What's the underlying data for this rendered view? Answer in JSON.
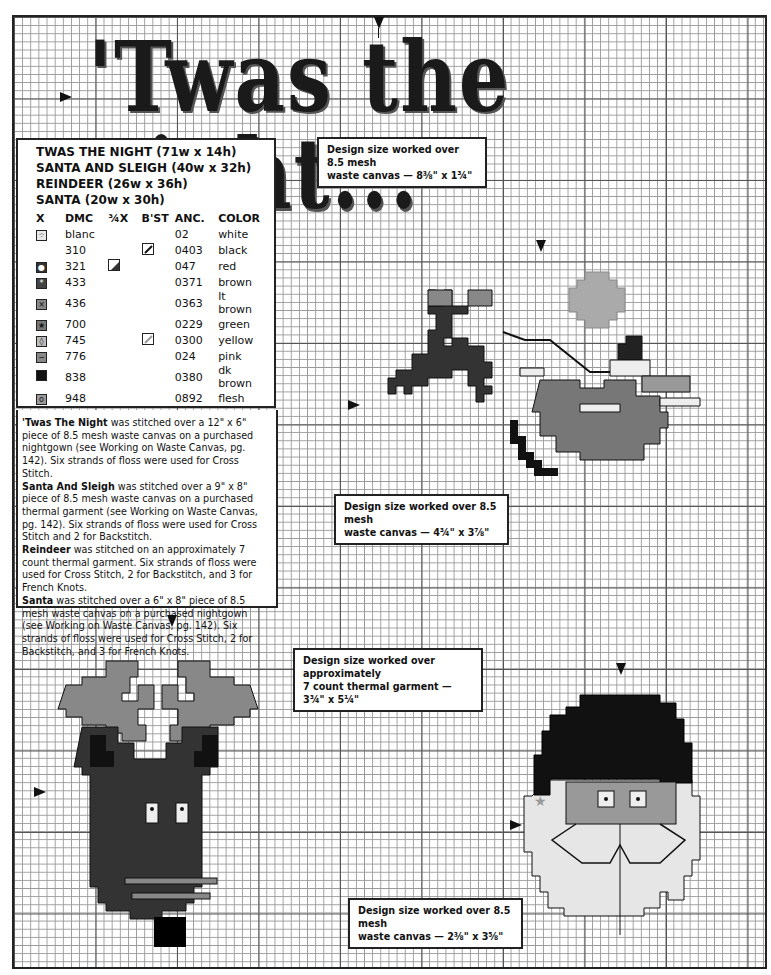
{
  "page": {
    "title_text": "'Twas the night...",
    "colors": {
      "grid_line": "#999999",
      "black": "#111111",
      "dark_brown": "#2a2a2a",
      "brown": "#444444",
      "red": "#3a3a3a",
      "lt_brown": "#8a8a8a",
      "green": "#7a7a7a",
      "yellow": "#bbbbbb",
      "pink": "#888888",
      "flesh": "#9a9a9a",
      "white": "#eeeeee"
    }
  },
  "legend": {
    "headings": [
      "TWAS THE NIGHT (71w x 14h)",
      "SANTA AND SLEIGH (40w x 32h)",
      "REINDEER (26w x 36h)",
      "SANTA (20w x 30h)"
    ],
    "columns": [
      "X",
      "DMC",
      "¾X",
      "B'ST",
      "ANC.",
      "COLOR"
    ],
    "rows": [
      {
        "symbol": "dots",
        "dmc": "blanc",
        "three_quarter": "",
        "backstitch": "",
        "anc": "02",
        "color": "white",
        "swatch": "#e8e8e8",
        "glyph": "⁘"
      },
      {
        "symbol": "",
        "dmc": "310",
        "three_quarter": "",
        "backstitch": "black-line",
        "anc": "0403",
        "color": "black",
        "swatch": "",
        "glyph": ""
      },
      {
        "symbol": "filled",
        "dmc": "321",
        "three_quarter": "half-dark",
        "backstitch": "",
        "anc": "047",
        "color": "red",
        "swatch": "#333333",
        "glyph": "●"
      },
      {
        "symbol": "star-dark",
        "dmc": "433",
        "three_quarter": "",
        "backstitch": "",
        "anc": "0371",
        "color": "brown",
        "swatch": "#444444",
        "glyph": "*"
      },
      {
        "symbol": "x",
        "dmc": "436",
        "three_quarter": "",
        "backstitch": "",
        "anc": "0363",
        "color": "lt brown",
        "swatch": "#888888",
        "glyph": "×"
      },
      {
        "symbol": "star",
        "dmc": "700",
        "three_quarter": "",
        "backstitch": "",
        "anc": "0229",
        "color": "green",
        "swatch": "#777777",
        "glyph": "★"
      },
      {
        "symbol": "diamond",
        "dmc": "745",
        "three_quarter": "",
        "backstitch": "gray-line",
        "anc": "0300",
        "color": "yellow",
        "swatch": "#bbbbbb",
        "glyph": "◊"
      },
      {
        "symbol": "dash",
        "dmc": "776",
        "three_quarter": "",
        "backstitch": "",
        "anc": "024",
        "color": "pink",
        "swatch": "#888888",
        "glyph": "−"
      },
      {
        "symbol": "solid",
        "dmc": "838",
        "three_quarter": "",
        "backstitch": "",
        "anc": "0380",
        "color": "dk brown",
        "swatch": "#111111",
        "glyph": ""
      },
      {
        "symbol": "circle",
        "dmc": "948",
        "three_quarter": "",
        "backstitch": "",
        "anc": "0892",
        "color": "flesh",
        "swatch": "#999999",
        "glyph": "o"
      }
    ],
    "french_knot": {
      "dmc": "310",
      "label": "black French Knot"
    },
    "jingle_bell": {
      "label": "placement of jingle bell on Santa design"
    }
  },
  "instructions": [
    {
      "bold": "'Twas The Night",
      "text": " was stitched over a 12\" x 6\" piece of 8.5 mesh waste canvas on a purchased nightgown (see Working on Waste Canvas, pg. 142). Six strands of floss were used for Cross Stitch."
    },
    {
      "bold": "Santa And Sleigh",
      "text": " was stitched over a 9\" x 8\" piece of 8.5 mesh waste canvas on a purchased thermal garment (see Working on Waste Canvas, pg. 142). Six strands of floss were used for Cross Stitch and 2 for Backstitch."
    },
    {
      "bold": "Reindeer",
      "text": " was stitched on an approximately 7 count thermal garment. Six strands of floss were used for Cross Stitch, 2 for Backstitch, and 3 for French Knots."
    },
    {
      "bold": "Santa",
      "text": " was stitched over a 6\" x 8\" piece of 8.5 mesh waste canvas on a purchased nightgown (see Working on Waste Canvas, pg. 142). Six strands of floss were used for Cross Stitch, 2 for Backstitch, and 3 for French Knots."
    }
  ],
  "size_notes": {
    "twas": {
      "line1": "Design size worked over 8.5 mesh",
      "line2": "waste canvas — 8⅜\" x 1¾\""
    },
    "sleigh": {
      "line1": "Design size worked over 8.5 mesh",
      "line2": "waste canvas — 4¾\" x 3⅞\""
    },
    "reindeer": {
      "line1": "Design size worked over approximately",
      "line2": "7 count thermal garment — 3¾\" x 5¼\""
    },
    "santa": {
      "line1": "Design size worked over 8.5 mesh",
      "line2": "waste canvas — 2⅜\" x 3⅝\""
    }
  },
  "motifs": {
    "sleigh_label": "Santa and sleigh with leaping reindeer and moon",
    "reindeer_label": "Reindeer head with antlers",
    "santa_label": "Santa face with hat and beard"
  }
}
